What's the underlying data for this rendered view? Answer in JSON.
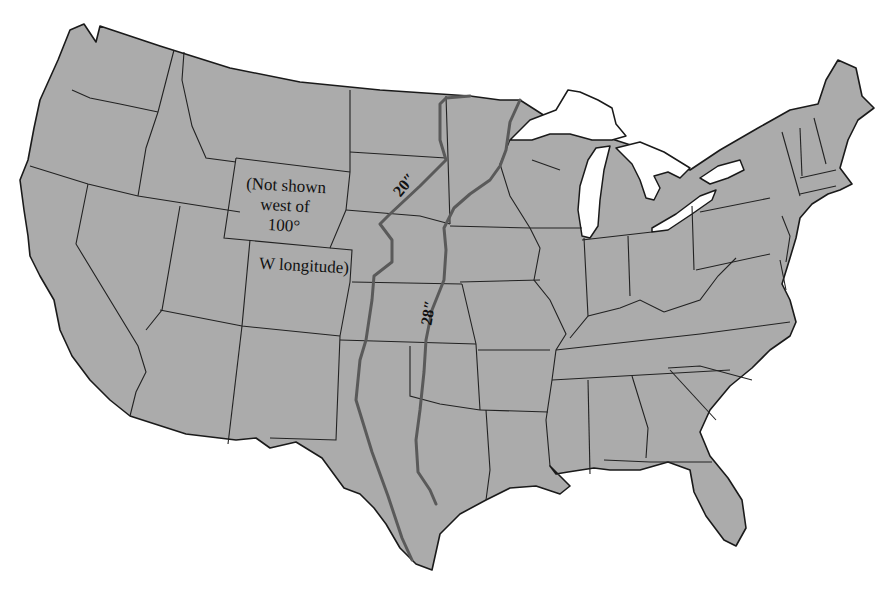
{
  "map": {
    "title": "",
    "region": "Contiguous United States",
    "colors": {
      "land": "#ababab",
      "water": "#ffffff",
      "borders": "#1a1a1a",
      "isohyet_lines": "#5a5a5a"
    },
    "note": {
      "line1": "(Not shown",
      "line2": "west of",
      "line3": "100°",
      "line4": "W longitude)"
    },
    "isohyets": [
      {
        "label": "20″",
        "value_inches": 20
      },
      {
        "label": "28″",
        "value_inches": 28
      }
    ]
  }
}
